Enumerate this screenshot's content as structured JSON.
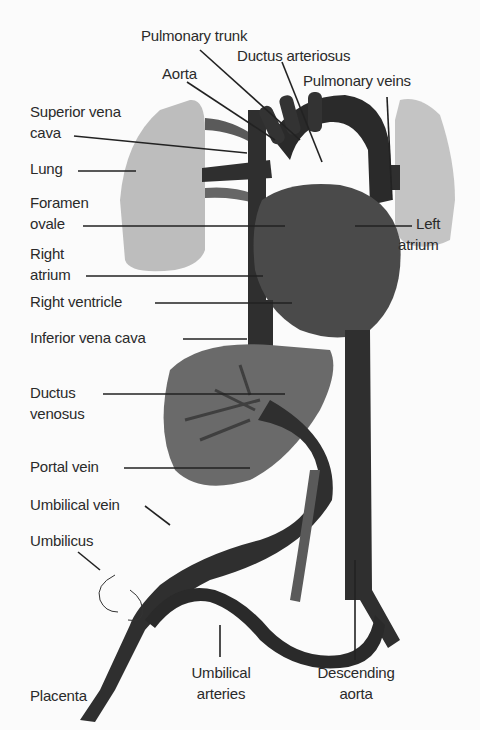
{
  "diagram": {
    "colors": {
      "background": "#fbfbfb",
      "lung": "#bdbdbd",
      "vessel_dark": "#2f2f2f",
      "heart": "#4a4a4a",
      "liver": "#6a6a6a",
      "label": "#2a2a2a"
    },
    "labels": {
      "pulmonary_trunk": "Pulmonary trunk",
      "ductus_arteriosus": "Ductus arteriosus",
      "aorta": "Aorta",
      "pulmonary_veins": "Pulmonary veins",
      "superior_vena_cava_1": "Superior vena",
      "superior_vena_cava_2": "cava",
      "lung": "Lung",
      "foramen_ovale_1": "Foramen",
      "foramen_ovale_2": "ovale",
      "left_atrium_1": "Left",
      "left_atrium_2": "atrium",
      "right_atrium_1": "Right",
      "right_atrium_2": "atrium",
      "right_ventricle": "Right ventricle",
      "inferior_vena_cava": "Inferior vena cava",
      "ductus_venosus_1": "Ductus",
      "ductus_venosus_2": "venosus",
      "portal_vein": "Portal vein",
      "umbilical_vein": "Umbilical vein",
      "umbilicus": "Umbilicus",
      "placenta": "Placenta",
      "umbilical_arteries_1": "Umbilical",
      "umbilical_arteries_2": "arteries",
      "descending_aorta_1": "Descending",
      "descending_aorta_2": "aorta"
    }
  }
}
